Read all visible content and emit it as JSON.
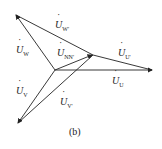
{
  "diagram": {
    "caption": "(b)",
    "labels": {
      "uw_prime": {
        "main": "U",
        "sub": "W'"
      },
      "uw": {
        "main": "U",
        "sub": "W"
      },
      "unn": {
        "main": "U",
        "sub": "NN'"
      },
      "uu_prime": {
        "main": "U",
        "sub": "U'"
      },
      "uu": {
        "main": "U",
        "sub": "U"
      },
      "uv": {
        "main": "U",
        "sub": "V"
      },
      "uv_prime": {
        "main": "U",
        "sub": "V'"
      }
    },
    "colors": {
      "line": "#222222"
    }
  }
}
